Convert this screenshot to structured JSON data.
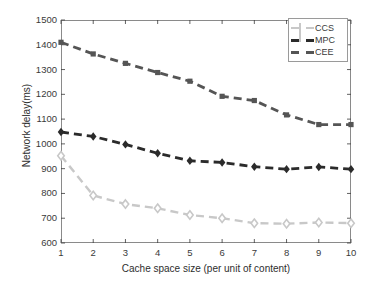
{
  "chart_data": {
    "type": "line",
    "title": "",
    "xlabel": "Cache space size (per unit of content)",
    "ylabel": "Network delay(ms)",
    "x": [
      1,
      2,
      3,
      4,
      5,
      6,
      7,
      8,
      9,
      10
    ],
    "xlim": [
      1,
      10
    ],
    "ylim": [
      600,
      1500
    ],
    "xticks": [
      "1",
      "2",
      "3",
      "4",
      "5",
      "6",
      "7",
      "8",
      "9",
      "10"
    ],
    "yticks": [
      "600",
      "700",
      "800",
      "900",
      "1000",
      "1100",
      "1200",
      "1300",
      "1400",
      "1500"
    ],
    "grid": false,
    "legend_position": "top-right",
    "series": [
      {
        "name": "CCS",
        "color": "#c8c8c8",
        "marker": "diamond",
        "linestyle": "dashed",
        "values": [
          952,
          792,
          757,
          740,
          713,
          700,
          680,
          678,
          683,
          680
        ]
      },
      {
        "name": "MPC",
        "color": "#2b2b2b",
        "marker": "diamond-filled",
        "linestyle": "dashed",
        "values": [
          1048,
          1030,
          998,
          962,
          932,
          925,
          908,
          898,
          907,
          898
        ]
      },
      {
        "name": "CEE",
        "color": "#555555",
        "marker": "square-filled",
        "linestyle": "dashed",
        "values": [
          1410,
          1363,
          1325,
          1288,
          1253,
          1192,
          1175,
          1117,
          1078,
          1078
        ]
      }
    ]
  },
  "legend": {
    "entries": [
      {
        "label": "CCS"
      },
      {
        "label": "MPC"
      },
      {
        "label": "CEE"
      }
    ]
  },
  "axes": {
    "frame_color": "#8a8a8a",
    "tick_color": "#3a3a3a"
  }
}
